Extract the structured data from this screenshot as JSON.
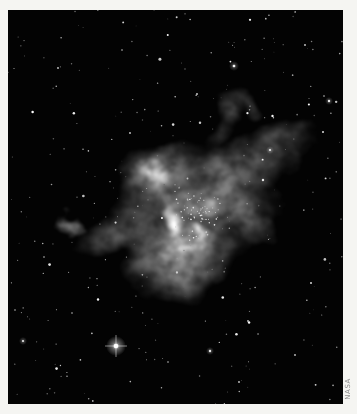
{
  "page": {
    "background": "#f5f5f2"
  },
  "photo": {
    "credit": "NASA",
    "credit_color": "#8f8f8f",
    "description": "Black-and-white space photograph of a wispy star-forming emission nebula at center, surrounded by a sparse field of faint stars on a black sky; one bright flaring star with diffraction spikes at lower left",
    "sky_color": "#030303",
    "frame": {
      "left": 8,
      "top": 10,
      "width": 335,
      "height": 394
    },
    "nebula": {
      "blobs": [
        {
          "cx": 175,
          "cy": 205,
          "rx": 75,
          "ry": 80,
          "rot": -8,
          "opacity": 0.42
        },
        {
          "cx": 148,
          "cy": 168,
          "rx": 46,
          "ry": 40,
          "rot": -20,
          "opacity": 0.4
        },
        {
          "cx": 225,
          "cy": 178,
          "rx": 50,
          "ry": 40,
          "rot": 12,
          "opacity": 0.34
        },
        {
          "cx": 168,
          "cy": 252,
          "rx": 58,
          "ry": 42,
          "rot": 4,
          "opacity": 0.38
        },
        {
          "cx": 103,
          "cy": 222,
          "rx": 36,
          "ry": 28,
          "rot": -15,
          "opacity": 0.3
        },
        {
          "cx": 253,
          "cy": 150,
          "rx": 46,
          "ry": 26,
          "rot": -22,
          "opacity": 0.26
        },
        {
          "cx": 288,
          "cy": 128,
          "rx": 36,
          "ry": 20,
          "rot": -30,
          "opacity": 0.2
        },
        {
          "cx": 213,
          "cy": 113,
          "rx": 16,
          "ry": 28,
          "rot": 8,
          "opacity": 0.24
        },
        {
          "cx": 236,
          "cy": 99,
          "rx": 24,
          "ry": 12,
          "rot": 30,
          "opacity": 0.2
        },
        {
          "cx": 232,
          "cy": 213,
          "rx": 30,
          "ry": 24,
          "rot": 18,
          "opacity": 0.26
        },
        {
          "cx": 65,
          "cy": 208,
          "rx": 11,
          "ry": 9,
          "rot": 0,
          "opacity": 0.45
        },
        {
          "cx": 193,
          "cy": 178,
          "rx": 23,
          "ry": 15,
          "rot": 10,
          "opacity": 0.5,
          "dark": true
        },
        {
          "cx": 213,
          "cy": 237,
          "rx": 17,
          "ry": 13,
          "rot": 0,
          "opacity": 0.45,
          "dark": true
        },
        {
          "cx": 148,
          "cy": 207,
          "rx": 9,
          "ry": 13,
          "rot": 0,
          "opacity": 0.32,
          "dark": true
        },
        {
          "cx": 162,
          "cy": 216,
          "rx": 13,
          "ry": 25,
          "rot": -24,
          "opacity": 0.85
        },
        {
          "cx": 142,
          "cy": 162,
          "rx": 15,
          "ry": 19,
          "rot": -14,
          "opacity": 0.6
        },
        {
          "cx": 196,
          "cy": 196,
          "rx": 24,
          "ry": 18,
          "rot": 0,
          "opacity": 0.4
        },
        {
          "cx": 172,
          "cy": 243,
          "rx": 19,
          "ry": 9,
          "rot": -8,
          "opacity": 0.55
        },
        {
          "cx": 186,
          "cy": 230,
          "rx": 8,
          "ry": 14,
          "rot": 20,
          "opacity": 0.6
        }
      ]
    },
    "stars": {
      "field": {
        "seed": 20240,
        "count": 300,
        "min_shade": 80,
        "max_shade": 200
      },
      "cluster": {
        "cx": 190,
        "cy": 202,
        "sd": 36,
        "count": 75
      },
      "bright_star": {
        "x": 108,
        "y": 336,
        "core_r": 2.3,
        "glow_r": 10,
        "spike_len": 11
      },
      "notable": [
        {
          "x": 226,
          "y": 56,
          "r": 1.3,
          "glow": 5,
          "shade": 245
        },
        {
          "x": 321,
          "y": 91,
          "r": 1.2,
          "glow": 4,
          "shade": 235
        },
        {
          "x": 316,
          "y": 86,
          "r": 0.8,
          "shade": 200
        },
        {
          "x": 262,
          "y": 140,
          "r": 1.1,
          "glow": 4,
          "shade": 230
        },
        {
          "x": 189,
          "y": 84,
          "r": 0.9,
          "shade": 215
        },
        {
          "x": 122,
          "y": 123,
          "r": 0.9,
          "shade": 210
        },
        {
          "x": 315,
          "y": 122,
          "r": 1.0,
          "shade": 220
        },
        {
          "x": 15,
          "y": 331,
          "r": 1.1,
          "glow": 4,
          "shade": 225
        },
        {
          "x": 7,
          "y": 300,
          "r": 0.8,
          "shade": 190
        },
        {
          "x": 202,
          "y": 341,
          "r": 1.2,
          "glow": 4,
          "shade": 230
        },
        {
          "x": 50,
          "y": 58,
          "r": 0.9,
          "shade": 205
        },
        {
          "x": 114,
          "y": 40,
          "r": 0.8,
          "shade": 195
        },
        {
          "x": 303,
          "y": 273,
          "r": 1.0,
          "shade": 215
        },
        {
          "x": 240,
          "y": 311,
          "r": 0.9,
          "shade": 205
        },
        {
          "x": 287,
          "y": 345,
          "r": 0.9,
          "shade": 200
        },
        {
          "x": 36,
          "y": 247,
          "r": 0.8,
          "shade": 195
        },
        {
          "x": 160,
          "y": 352,
          "r": 0.8,
          "shade": 195
        },
        {
          "x": 231,
          "y": 372,
          "r": 0.9,
          "shade": 205
        },
        {
          "x": 297,
          "y": 35,
          "r": 0.9,
          "shade": 210
        },
        {
          "x": 64,
          "y": 303,
          "r": 0.8,
          "shade": 190
        }
      ]
    }
  }
}
